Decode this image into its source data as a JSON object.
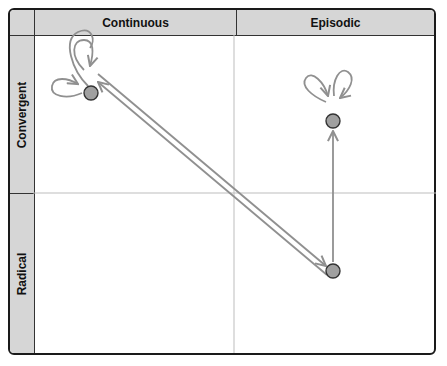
{
  "columns": [
    {
      "label": "Continuous"
    },
    {
      "label": "Episodic"
    }
  ],
  "rows": [
    {
      "label": "Convergent"
    },
    {
      "label": "Radical"
    }
  ],
  "nodes": [
    {
      "id": "continuous-convergent",
      "column": "Continuous",
      "row": "Convergent",
      "self_loops": 2
    },
    {
      "id": "episodic-convergent",
      "column": "Episodic",
      "row": "Convergent",
      "self_loops": 2
    },
    {
      "id": "episodic-radical",
      "column": "Episodic",
      "row": "Radical",
      "self_loops": 0
    }
  ],
  "edges": [
    {
      "from": "continuous-convergent",
      "to": "episodic-radical",
      "style": "double-line"
    },
    {
      "from": "episodic-radical",
      "to": "continuous-convergent",
      "style": "double-line"
    },
    {
      "from": "episodic-radical",
      "to": "episodic-convergent",
      "style": "single-line"
    }
  ],
  "colors": {
    "header_bg": "#d6d6d6",
    "node_fill": "#a0a0a0",
    "node_stroke": "#333333",
    "arrow": "#909090",
    "grid": "#bdbdbd",
    "frame": "#1a1a1a"
  }
}
